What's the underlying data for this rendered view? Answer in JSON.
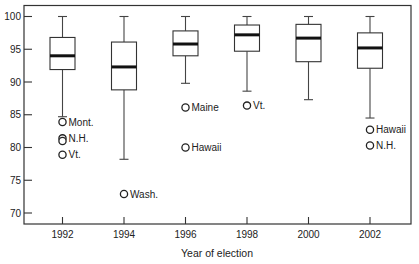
{
  "chart_data": {
    "type": "boxplot",
    "title": "",
    "xlabel": "Year of election",
    "ylabel": "",
    "ylim": [
      68,
      101.7
    ],
    "yticks": [
      70,
      75,
      80,
      85,
      90,
      95,
      100
    ],
    "grid": false,
    "legend": "none",
    "categories": [
      "1992",
      "1994",
      "1996",
      "1998",
      "2000",
      "2002"
    ],
    "boxes": [
      {
        "category": "1992",
        "whisker_low": 84.7,
        "q1": 91.9,
        "median": 94.0,
        "q3": 96.8,
        "whisker_high": 100,
        "outliers": [
          {
            "label": "Mont.",
            "value": 83.9
          },
          {
            "label": "N.H.",
            "value": 81.4
          },
          {
            "label": "",
            "value": 81.0
          },
          {
            "label": "Vt.",
            "value": 78.9
          }
        ]
      },
      {
        "category": "1994",
        "whisker_low": 78.2,
        "q1": 88.8,
        "median": 92.3,
        "q3": 96.1,
        "whisker_high": 100,
        "outliers": [
          {
            "label": "Wash.",
            "value": 72.9
          }
        ]
      },
      {
        "category": "1996",
        "whisker_low": 89.8,
        "q1": 94.0,
        "median": 95.8,
        "q3": 97.8,
        "whisker_high": 100,
        "outliers": [
          {
            "label": "Maine",
            "value": 86.1
          },
          {
            "label": "Hawaii",
            "value": 80.0
          }
        ]
      },
      {
        "category": "1998",
        "whisker_low": 88.6,
        "q1": 94.7,
        "median": 97.2,
        "q3": 98.7,
        "whisker_high": 100,
        "outliers": [
          {
            "label": "Vt.",
            "value": 86.4
          }
        ]
      },
      {
        "category": "2000",
        "whisker_low": 87.3,
        "q1": 93.1,
        "median": 96.7,
        "q3": 98.8,
        "whisker_high": 100,
        "outliers": []
      },
      {
        "category": "2002",
        "whisker_low": 84.5,
        "q1": 92.1,
        "median": 95.2,
        "q3": 97.5,
        "whisker_high": 100,
        "outliers": [
          {
            "label": "Hawaii",
            "value": 82.7
          },
          {
            "label": "N.H.",
            "value": 80.3
          }
        ]
      }
    ]
  }
}
